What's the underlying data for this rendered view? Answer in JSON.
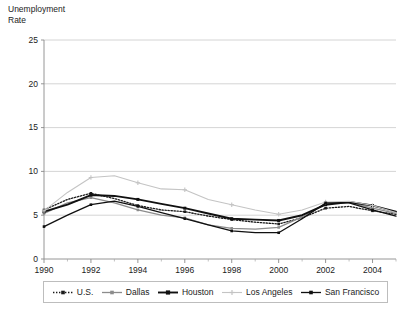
{
  "chart_data": {
    "type": "line",
    "title": "Unemployment\nRate",
    "xlabel": "",
    "ylabel": "Unemployment Rate",
    "xlim": [
      1990,
      2005
    ],
    "ylim": [
      0,
      25
    ],
    "ytick_values": [
      0,
      5,
      10,
      15,
      20,
      25
    ],
    "ytick_labels": [
      "0",
      "5",
      "10",
      "15",
      "20",
      "25"
    ],
    "xtick_values": [
      1990,
      1992,
      1994,
      1996,
      1998,
      2000,
      2002,
      2004
    ],
    "xtick_labels": [
      "1990",
      "1992",
      "1994",
      "1996",
      "1998",
      "2000",
      "2002",
      "2004"
    ],
    "xtick_minor_values": [
      1991,
      1993,
      1995,
      1997,
      1999,
      2001,
      2003,
      2005
    ],
    "grid": "horizontal",
    "legend_position": "bottom",
    "x": [
      1990,
      1991,
      1992,
      1993,
      1994,
      1995,
      1996,
      1997,
      1998,
      1999,
      2000,
      2001,
      2002,
      2003,
      2004,
      2005
    ],
    "series": [
      {
        "name": "U.S.",
        "color": "#1b1b1b",
        "style": "dotted",
        "marker": "square",
        "values": [
          5.6,
          6.8,
          7.5,
          6.9,
          6.1,
          5.6,
          5.4,
          4.9,
          4.5,
          4.2,
          4.0,
          4.7,
          5.8,
          6.0,
          5.5,
          5.1
        ]
      },
      {
        "name": "Dallas",
        "color": "#8c8c8c",
        "style": "solid",
        "marker": "square",
        "values": [
          5.2,
          6.4,
          7.0,
          6.4,
          5.6,
          5.0,
          4.7,
          3.9,
          3.5,
          3.4,
          3.6,
          4.8,
          6.3,
          6.5,
          5.8,
          5.2
        ]
      },
      {
        "name": "Houston",
        "color": "#101010",
        "style": "solid-bold",
        "marker": "square",
        "values": [
          5.4,
          6.2,
          7.3,
          7.2,
          6.8,
          6.3,
          5.8,
          5.2,
          4.6,
          4.5,
          4.4,
          5.0,
          6.2,
          6.5,
          6.1,
          5.4
        ]
      },
      {
        "name": "Los Angeles",
        "color": "#c4c4c4",
        "style": "solid-light",
        "marker": "plus",
        "values": [
          5.5,
          7.6,
          9.3,
          9.5,
          8.7,
          8.0,
          7.9,
          6.8,
          6.2,
          5.6,
          5.1,
          5.6,
          6.5,
          6.6,
          6.1,
          5.3
        ]
      },
      {
        "name": "San Francisco",
        "color": "#101010",
        "style": "solid",
        "marker": "square",
        "values": [
          3.7,
          5.0,
          6.2,
          6.6,
          6.0,
          5.3,
          4.6,
          3.9,
          3.2,
          3.0,
          3.0,
          4.6,
          6.4,
          6.4,
          5.6,
          4.9
        ]
      }
    ]
  },
  "legend": {
    "items": [
      {
        "label": "U.S."
      },
      {
        "label": "Dallas"
      },
      {
        "label": "Houston"
      },
      {
        "label": "Los Angeles"
      },
      {
        "label": "San Francisco"
      }
    ]
  }
}
